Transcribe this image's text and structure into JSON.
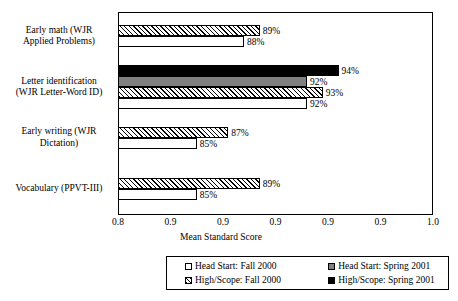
{
  "chart_data": {
    "type": "bar",
    "orientation": "horizontal",
    "title": "",
    "xlabel": "Mean Standard Score",
    "ylabel": "",
    "xlim": [
      0.8,
      1.0
    ],
    "grid": false,
    "legend_position": "bottom",
    "xticks": [
      0.8,
      0.8333,
      0.8667,
      0.9,
      0.9333,
      0.9667,
      1.0
    ],
    "xtick_labels": [
      "0.8",
      "0.9",
      "0.9",
      "0.9",
      "0.9",
      "0.9",
      "1.0"
    ],
    "categories": [
      "Early math (WJR Applied Problems)",
      "Letter identification (WJR Letter-Word ID)",
      "Early writing (WJR Dictation)",
      "Vocabulary (PPVT-III)"
    ],
    "series": [
      {
        "name": "Head Start: Fall 2000",
        "style": "white",
        "values": [
          0.88,
          0.92,
          0.85,
          0.85
        ],
        "labels": [
          "88%",
          "92%",
          "85%",
          "85%"
        ]
      },
      {
        "name": "Head Start: Spring 2001",
        "style": "gray",
        "values": [
          null,
          0.92,
          null,
          null
        ],
        "labels": [
          null,
          "92%",
          null,
          null
        ]
      },
      {
        "name": "High/Scope: Fall 2000",
        "style": "hatch",
        "values": [
          0.89,
          0.93,
          0.87,
          0.89
        ],
        "labels": [
          "89%",
          "93%",
          "87%",
          "89%"
        ]
      },
      {
        "name": "High/Scope: Spring 2001",
        "style": "black",
        "values": [
          null,
          0.94,
          null,
          null
        ],
        "labels": [
          null,
          "94%",
          null,
          null
        ]
      }
    ],
    "bars": [
      {
        "group": 0,
        "series": "High/Scope: Fall 2000",
        "style": "hatch",
        "value": 0.89,
        "label": "89%"
      },
      {
        "group": 0,
        "series": "Head Start: Fall 2000",
        "style": "white",
        "value": 0.88,
        "label": "88%"
      },
      {
        "group": 1,
        "series": "High/Scope: Spring 2001",
        "style": "black",
        "value": 0.94,
        "label": "94%"
      },
      {
        "group": 1,
        "series": "Head Start: Spring 2001",
        "style": "gray",
        "value": 0.92,
        "label": "92%"
      },
      {
        "group": 1,
        "series": "High/Scope: Fall 2000",
        "style": "hatch",
        "value": 0.93,
        "label": "93%"
      },
      {
        "group": 1,
        "series": "Head Start: Fall 2000",
        "style": "white",
        "value": 0.92,
        "label": "92%"
      },
      {
        "group": 2,
        "series": "High/Scope: Fall 2000",
        "style": "hatch",
        "value": 0.87,
        "label": "87%"
      },
      {
        "group": 2,
        "series": "Head Start: Fall 2000",
        "style": "white",
        "value": 0.85,
        "label": "85%"
      },
      {
        "group": 3,
        "series": "High/Scope: Fall 2000",
        "style": "hatch",
        "value": 0.89,
        "label": "89%"
      },
      {
        "group": 3,
        "series": "Head Start: Fall 2000",
        "style": "white",
        "value": 0.85,
        "label": "85%"
      }
    ]
  },
  "axis": {
    "x_title": "Mean Standard Score",
    "tick_labels": [
      "0.8",
      "0.9",
      "0.9",
      "0.9",
      "0.9",
      "0.9",
      "1.0"
    ]
  },
  "category_labels": [
    {
      "line1": "Early math (WJR",
      "line2": "Applied Problems)"
    },
    {
      "line1": "Letter identification",
      "line2": "(WJR Letter-Word ID)"
    },
    {
      "line1": "Early writing (WJR",
      "line2": "Dictation)"
    },
    {
      "line1": "Vocabulary (PPVT-III)",
      "line2": ""
    }
  ],
  "legend": {
    "entries": [
      {
        "label": "Head Start: Fall 2000",
        "style": "white"
      },
      {
        "label": "Head Start: Spring 2001",
        "style": "gray"
      },
      {
        "label": "High/Scope: Fall 2000",
        "style": "hatch"
      },
      {
        "label": "High/Scope: Spring 2001",
        "style": "black"
      }
    ]
  },
  "colors": {
    "axis": "#000000",
    "bar_outline": "#000000",
    "fill_white": "#ffffff",
    "fill_gray": "#808080",
    "fill_black": "#000000",
    "background": "#ffffff"
  }
}
